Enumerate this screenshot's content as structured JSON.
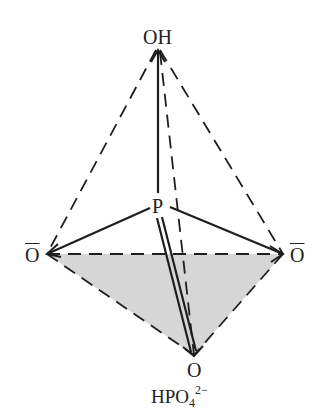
{
  "diagram": {
    "atoms": {
      "top": "OH",
      "center": "P",
      "left": "O",
      "right": "O",
      "bottom": "O"
    },
    "caption": {
      "base": "HPO",
      "subscript": "4",
      "superscript": "2−"
    },
    "colors": {
      "line": "#1e1e1e",
      "shaded_face": "#d6d6d6",
      "background": "#ffffff"
    }
  }
}
